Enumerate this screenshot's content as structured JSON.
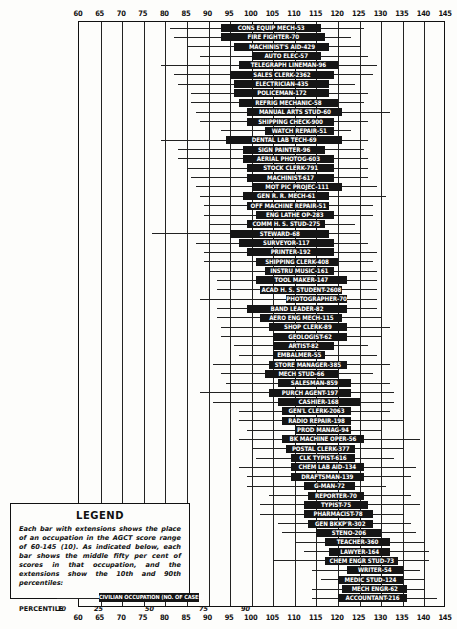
{
  "chart_data": {
    "type": "box",
    "title": "",
    "xlabel": "AGCT score",
    "ylabel": "",
    "xlim": [
      60,
      145
    ],
    "x_ticks": [
      60,
      65,
      70,
      75,
      80,
      85,
      90,
      95,
      100,
      105,
      110,
      115,
      120,
      125,
      130,
      135,
      140,
      145
    ],
    "grid": true,
    "percentiles_shown": [
      "p10",
      "p25",
      "p75",
      "p90"
    ],
    "series": [
      {
        "label": "CONS EQUIP MECH-53",
        "p10": 81,
        "p25": 93,
        "p75": 116,
        "p90": 126
      },
      {
        "label": "FIRE FIGHTER-70",
        "p10": 82,
        "p25": 93,
        "p75": 117,
        "p90": 123
      },
      {
        "label": "MACHINIST'S AID-429",
        "p10": 85,
        "p25": 96,
        "p75": 118,
        "p90": 125
      },
      {
        "label": "AUTO ELEC-57",
        "p10": 88,
        "p25": 100,
        "p75": 116,
        "p90": 127
      },
      {
        "label": "TELEGRAPH LINEMAN-96",
        "p10": 79,
        "p25": 97,
        "p75": 120,
        "p90": 129
      },
      {
        "label": "SALES CLERK-2362",
        "p10": 82,
        "p25": 95,
        "p75": 119,
        "p90": 128
      },
      {
        "label": "ELECTRICIAN-435",
        "p10": 83,
        "p25": 96,
        "p75": 118,
        "p90": 124
      },
      {
        "label": "POLICEMAN-172",
        "p10": 86,
        "p25": 96,
        "p75": 118,
        "p90": 127
      },
      {
        "label": "REFRIG MECHANIC-58",
        "p10": 86,
        "p25": 97,
        "p75": 120,
        "p90": 126
      },
      {
        "label": "MANUAL ARTS STUD-60",
        "p10": 87,
        "p25": 99,
        "p75": 121,
        "p90": 132
      },
      {
        "label": "SHIPPING CHECK-900",
        "p10": 88,
        "p25": 99,
        "p75": 119,
        "p90": 127
      },
      {
        "label": "WATCH REPAIR-51",
        "p10": 93,
        "p25": 103,
        "p75": 119,
        "p90": 123
      },
      {
        "label": "DENTAL LAB TECH-69",
        "p10": 79,
        "p25": 94,
        "p75": 121,
        "p90": 127
      },
      {
        "label": "SIGN PAINTER-96",
        "p10": 83,
        "p25": 98,
        "p75": 117,
        "p90": 126
      },
      {
        "label": "AERIAL PHOTOG-603",
        "p10": 83,
        "p25": 98,
        "p75": 119,
        "p90": 127
      },
      {
        "label": "STOCK CLERK-791",
        "p10": 85,
        "p25": 99,
        "p75": 119,
        "p90": 127
      },
      {
        "label": "MACHINIST-617",
        "p10": 86,
        "p25": 99,
        "p75": 119,
        "p90": 127
      },
      {
        "label": "MOT PIC PROJEC-111",
        "p10": 87,
        "p25": 100,
        "p75": 121,
        "p90": 129
      },
      {
        "label": "GEN R. R. MECH-61",
        "p10": 88,
        "p25": 98,
        "p75": 118,
        "p90": 131
      },
      {
        "label": "OFF MACHINE REPAIR-51",
        "p10": 89,
        "p25": 99,
        "p75": 118,
        "p90": 128
      },
      {
        "label": "ENG LATHE OP-283",
        "p10": 89,
        "p25": 101,
        "p75": 119,
        "p90": 128
      },
      {
        "label": "COMM H. S. STUD-275",
        "p10": 90,
        "p25": 99,
        "p75": 117,
        "p90": 124
      },
      {
        "label": "STEWARD-68",
        "p10": 77,
        "p25": 95,
        "p75": 118,
        "p90": 125
      },
      {
        "label": "SURVEYOR-117",
        "p10": 87,
        "p25": 97,
        "p75": 119,
        "p90": 127
      },
      {
        "label": "PRINTER-192",
        "p10": 89,
        "p25": 99,
        "p75": 119,
        "p90": 129
      },
      {
        "label": "SHIPPING CLERK-408",
        "p10": 89,
        "p25": 101,
        "p75": 120,
        "p90": 128
      },
      {
        "label": "INSTRU MUSIC-161",
        "p10": 90,
        "p25": 103,
        "p75": 119,
        "p90": 129
      },
      {
        "label": "TOOL MAKER-147",
        "p10": 92,
        "p25": 101,
        "p75": 122,
        "p90": 129
      },
      {
        "label": "ACAD H. S. STUDENT-2608",
        "p10": 92,
        "p25": 102,
        "p75": 121,
        "p90": 129
      },
      {
        "label": "PHOTOGRAPHER-70",
        "p10": 88,
        "p25": 108,
        "p75": 122,
        "p90": 129
      },
      {
        "label": "BAND LEADER-82",
        "p10": 92,
        "p25": 99,
        "p75": 122,
        "p90": 129
      },
      {
        "label": "AERO ENG MECH-115",
        "p10": 92,
        "p25": 102,
        "p75": 121,
        "p90": 130
      },
      {
        "label": "SHOP CLERK-89",
        "p10": 93,
        "p25": 104,
        "p75": 122,
        "p90": 132
      },
      {
        "label": "GEOLOGIST-62",
        "p10": 93,
        "p25": 105,
        "p75": 122,
        "p90": 130
      },
      {
        "label": "ARTIST-82",
        "p10": 96,
        "p25": 105,
        "p75": 119,
        "p90": 127
      },
      {
        "label": "EMBALMER-55",
        "p10": 97,
        "p25": 105,
        "p75": 117,
        "p90": 129
      },
      {
        "label": "STORE MANAGER-385",
        "p10": 91,
        "p25": 104,
        "p75": 122,
        "p90": 132
      },
      {
        "label": "MECH STUD-66",
        "p10": 93,
        "p25": 103,
        "p75": 120,
        "p90": 128
      },
      {
        "label": "SALESMAN-859",
        "p10": 94,
        "p25": 106,
        "p75": 123,
        "p90": 132
      },
      {
        "label": "PURCH AGENT-197",
        "p10": 88,
        "p25": 104,
        "p75": 123,
        "p90": 133
      },
      {
        "label": "CASHIER-168",
        "p10": 91,
        "p25": 106,
        "p75": 125,
        "p90": 133
      },
      {
        "label": "GEN'L CLERK-2063",
        "p10": 97,
        "p25": 107,
        "p75": 123,
        "p90": 132
      },
      {
        "label": "RADIO REPAIR-198",
        "p10": 97,
        "p25": 107,
        "p75": 123,
        "p90": 135
      },
      {
        "label": "PROD MANAG-94",
        "p10": 99,
        "p25": 110,
        "p75": 123,
        "p90": 130
      },
      {
        "label": "BK MACHINE OPER-56",
        "p10": 97,
        "p25": 107,
        "p75": 126,
        "p90": 139
      },
      {
        "label": "POSTAL CLERK-377",
        "p10": 100,
        "p25": 108,
        "p75": 124,
        "p90": 135
      },
      {
        "label": "CLK TYPIST-616",
        "p10": 101,
        "p25": 109,
        "p75": 124,
        "p90": 133
      },
      {
        "label": "CHEM LAB AID-134",
        "p10": 97,
        "p25": 109,
        "p75": 126,
        "p90": 138
      },
      {
        "label": "DRAFTSMAN-139",
        "p10": 99,
        "p25": 109,
        "p75": 126,
        "p90": 137
      },
      {
        "label": "G-MAN-72",
        "p10": 99,
        "p25": 112,
        "p75": 124,
        "p90": 131
      },
      {
        "label": "REPORTER-70",
        "p10": 104,
        "p25": 113,
        "p75": 126,
        "p90": 137
      },
      {
        "label": "TYPIST-75",
        "p10": 102,
        "p25": 112,
        "p75": 127,
        "p90": 139
      },
      {
        "label": "PHARMACIST-78",
        "p10": 102,
        "p25": 112,
        "p75": 128,
        "p90": 135
      },
      {
        "label": "GEN BKKP'R-302",
        "p10": 106,
        "p25": 113,
        "p75": 128,
        "p90": 137
      },
      {
        "label": "STENO-206",
        "p10": 107,
        "p25": 115,
        "p75": 130,
        "p90": 138
      },
      {
        "label": "TEACHER-360",
        "p10": 110,
        "p25": 117,
        "p75": 132,
        "p90": 140
      },
      {
        "label": "LAWYER-164",
        "p10": 112,
        "p25": 118,
        "p75": 132,
        "p90": 141
      },
      {
        "label": "CHEM ENGR STUD-73",
        "p10": 105,
        "p25": 117,
        "p75": 134,
        "p90": 141
      },
      {
        "label": "WRITER-54",
        "p10": 114,
        "p25": 122,
        "p75": 135,
        "p90": 139
      },
      {
        "label": "MEDIC STUD-124",
        "p10": 116,
        "p25": 120,
        "p75": 135,
        "p90": 140
      },
      {
        "label": "MECH ENGR-62",
        "p10": 114,
        "p25": 121,
        "p75": 136,
        "p90": 140
      },
      {
        "label": "ACCOUNTANT-216",
        "p10": 114,
        "p25": 120,
        "p75": 136,
        "p90": 143
      }
    ]
  },
  "axis": {
    "ticks": [
      "60",
      "65",
      "70",
      "75",
      "80",
      "85",
      "90",
      "95",
      "100",
      "105",
      "110",
      "115",
      "120",
      "125",
      "130",
      "135",
      "140",
      "145"
    ]
  },
  "legend": {
    "title": "LEGEND",
    "text": "Each bar with extensions shows the place of an occupation in the AGCT score range of 60-145 (10). As indicated below, each bar shows the middle fifty per cent of scores in that occupation, and the extensions show the 10th and 90th percentiles:",
    "sample_label": "CIVILIAN OCCUPATION (NO. OF CASES)",
    "percentile_label": "PERCENTILE",
    "percentiles": [
      "10",
      "25",
      "50",
      "75",
      "90"
    ]
  }
}
